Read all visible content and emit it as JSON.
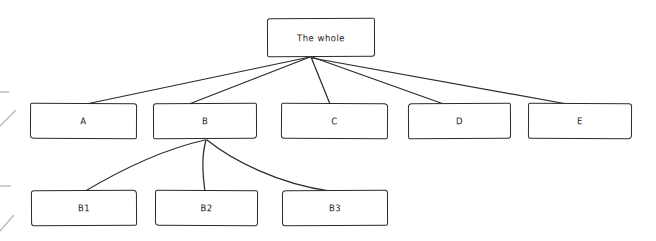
{
  "diagram": {
    "type": "hierarchy-tree",
    "style": "hand-drawn",
    "background_color": "#ffffff",
    "stroke_color": "#2b2b2b",
    "text_color": "#1c1c1c",
    "nodes": [
      {
        "id": "root",
        "label": "The whole",
        "level": 0,
        "x": 267,
        "y": 18,
        "w": 108,
        "h": 39
      },
      {
        "id": "a",
        "label": "A",
        "level": 1,
        "x": 30,
        "y": 103,
        "w": 107,
        "h": 36
      },
      {
        "id": "b",
        "label": "B",
        "level": 1,
        "x": 153,
        "y": 103,
        "w": 104,
        "h": 36
      },
      {
        "id": "c",
        "label": "C",
        "level": 1,
        "x": 281,
        "y": 103,
        "w": 107,
        "h": 36
      },
      {
        "id": "d",
        "label": "D",
        "level": 1,
        "x": 408,
        "y": 103,
        "w": 103,
        "h": 36
      },
      {
        "id": "e",
        "label": "E",
        "level": 1,
        "x": 528,
        "y": 103,
        "w": 104,
        "h": 36
      },
      {
        "id": "b1",
        "label": "B1",
        "level": 2,
        "x": 31,
        "y": 190,
        "w": 106,
        "h": 36
      },
      {
        "id": "b2",
        "label": "B2",
        "level": 2,
        "x": 155,
        "y": 190,
        "w": 103,
        "h": 36
      },
      {
        "id": "b3",
        "label": "B3",
        "level": 2,
        "x": 282,
        "y": 190,
        "w": 106,
        "h": 36
      }
    ],
    "edges": [
      {
        "from": "root",
        "to": "a",
        "shape": "straight",
        "path": "M 310 57 L 72 107"
      },
      {
        "from": "root",
        "to": "b",
        "shape": "straight",
        "path": "M 310 57 L 184 106"
      },
      {
        "from": "root",
        "to": "c",
        "shape": "straight",
        "path": "M 311 57 L 330 104"
      },
      {
        "from": "root",
        "to": "d",
        "shape": "straight",
        "path": "M 312 57 L 452 107"
      },
      {
        "from": "root",
        "to": "e",
        "shape": "straight",
        "path": "M 312 58 L 578 106"
      },
      {
        "from": "b",
        "to": "b1",
        "shape": "curved",
        "path": "M 205 140 C 160 150, 112 175, 82 193"
      },
      {
        "from": "b",
        "to": "b2",
        "shape": "curved",
        "path": "M 206 140 C 201 158, 203 176, 205 192"
      },
      {
        "from": "b",
        "to": "b3",
        "shape": "curved",
        "path": "M 207 140 C 232 160, 278 184, 330 191"
      }
    ],
    "margin_artifacts": [
      {
        "id": "tick-top",
        "x": 0,
        "y": 92,
        "w": 9,
        "h": 1.5,
        "kind": "horizontal-tick"
      },
      {
        "id": "tick-bottom",
        "x": 0,
        "y": 186,
        "w": 11,
        "h": 1.5,
        "kind": "horizontal-tick"
      },
      {
        "id": "slash-upper",
        "x": 0,
        "y": 110,
        "w": 16,
        "h": 16,
        "kind": "diagonal-stroke"
      },
      {
        "id": "slash-lower",
        "x": 0,
        "y": 215,
        "w": 14,
        "h": 16,
        "kind": "diagonal-stroke"
      }
    ]
  }
}
